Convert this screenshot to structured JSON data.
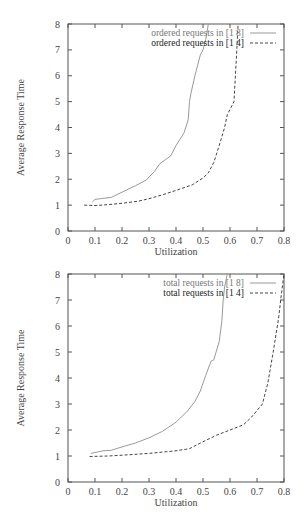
{
  "chart_data": [
    {
      "type": "line",
      "title": "",
      "xlabel": "Utilization",
      "ylabel": "Average Response Time",
      "xlim": [
        0,
        0.8
      ],
      "ylim": [
        0,
        8
      ],
      "xticks": [
        "0",
        "0.1",
        "0.2",
        "0.3",
        "0.4",
        "0.5",
        "0.6",
        "0.7",
        "0.8"
      ],
      "yticks": [
        "0",
        "1",
        "2",
        "3",
        "4",
        "5",
        "6",
        "7",
        "8"
      ],
      "grid": false,
      "legend_position": "top-right",
      "series": [
        {
          "name": "ordered requests in [1 8]",
          "style": "solid",
          "points": [
            [
              0.09,
              1.12
            ],
            [
              0.1,
              1.22
            ],
            [
              0.12,
              1.25
            ],
            [
              0.16,
              1.3
            ],
            [
              0.2,
              1.5
            ],
            [
              0.25,
              1.75
            ],
            [
              0.29,
              1.97
            ],
            [
              0.32,
              2.3
            ],
            [
              0.34,
              2.6
            ],
            [
              0.36,
              2.75
            ],
            [
              0.38,
              2.9
            ],
            [
              0.4,
              3.3
            ],
            [
              0.43,
              3.8
            ],
            [
              0.445,
              4.3
            ],
            [
              0.45,
              5.0
            ],
            [
              0.455,
              5.3
            ],
            [
              0.47,
              6.0
            ],
            [
              0.49,
              6.8
            ],
            [
              0.5,
              7.0
            ],
            [
              0.51,
              7.4
            ],
            [
              0.52,
              8.0
            ]
          ]
        },
        {
          "name": "ordered requests in [1 4]",
          "style": "dashed",
          "points": [
            [
              0.06,
              1.0
            ],
            [
              0.1,
              0.98
            ],
            [
              0.15,
              1.02
            ],
            [
              0.2,
              1.07
            ],
            [
              0.26,
              1.15
            ],
            [
              0.3,
              1.25
            ],
            [
              0.35,
              1.4
            ],
            [
              0.4,
              1.57
            ],
            [
              0.46,
              1.78
            ],
            [
              0.5,
              2.05
            ],
            [
              0.52,
              2.25
            ],
            [
              0.54,
              2.65
            ],
            [
              0.56,
              3.3
            ],
            [
              0.58,
              4.0
            ],
            [
              0.59,
              4.5
            ],
            [
              0.61,
              4.9
            ],
            [
              0.615,
              5.0
            ],
            [
              0.62,
              6.0
            ],
            [
              0.625,
              7.0
            ],
            [
              0.63,
              8.0
            ]
          ]
        }
      ]
    },
    {
      "type": "line",
      "title": "",
      "xlabel": "Utilization",
      "ylabel": "Average Response Time",
      "xlim": [
        0,
        0.8
      ],
      "ylim": [
        0,
        8
      ],
      "xticks": [
        "0",
        "0.1",
        "0.2",
        "0.3",
        "0.4",
        "0.5",
        "0.6",
        "0.7",
        "0.8"
      ],
      "yticks": [
        "0",
        "1",
        "2",
        "3",
        "4",
        "5",
        "6",
        "7",
        "8"
      ],
      "grid": false,
      "legend_position": "top-right",
      "series": [
        {
          "name": "total requests in [1 8]",
          "style": "solid",
          "points": [
            [
              0.085,
              1.1
            ],
            [
              0.13,
              1.2
            ],
            [
              0.16,
              1.22
            ],
            [
              0.2,
              1.35
            ],
            [
              0.25,
              1.5
            ],
            [
              0.3,
              1.7
            ],
            [
              0.35,
              1.95
            ],
            [
              0.4,
              2.3
            ],
            [
              0.44,
              2.7
            ],
            [
              0.47,
              3.1
            ],
            [
              0.49,
              3.5
            ],
            [
              0.51,
              4.1
            ],
            [
              0.53,
              4.65
            ],
            [
              0.54,
              4.7
            ],
            [
              0.56,
              5.4
            ],
            [
              0.57,
              6.2
            ],
            [
              0.575,
              7.0
            ],
            [
              0.58,
              7.5
            ],
            [
              0.59,
              8.0
            ]
          ]
        },
        {
          "name": "total requests in [1 4]",
          "style": "dashed",
          "points": [
            [
              0.08,
              0.98
            ],
            [
              0.15,
              1.0
            ],
            [
              0.2,
              1.03
            ],
            [
              0.3,
              1.1
            ],
            [
              0.4,
              1.2
            ],
            [
              0.45,
              1.28
            ],
            [
              0.5,
              1.55
            ],
            [
              0.55,
              1.8
            ],
            [
              0.6,
              2.0
            ],
            [
              0.65,
              2.2
            ],
            [
              0.68,
              2.5
            ],
            [
              0.72,
              3.0
            ],
            [
              0.74,
              3.8
            ],
            [
              0.76,
              5.0
            ],
            [
              0.78,
              6.3
            ],
            [
              0.79,
              7.2
            ],
            [
              0.8,
              8.0
            ]
          ]
        }
      ]
    }
  ]
}
